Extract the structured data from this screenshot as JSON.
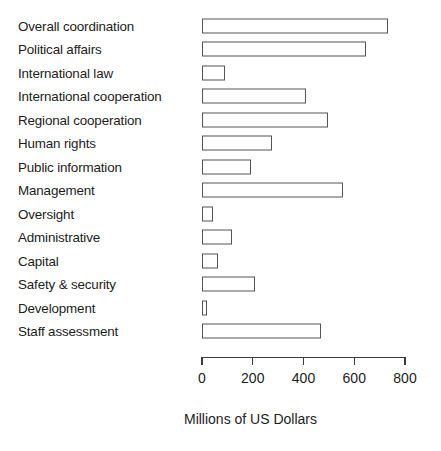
{
  "chart_data": {
    "type": "bar",
    "orientation": "horizontal",
    "title": "",
    "subtitle": "",
    "xlabel": "Millions of US Dollars",
    "ylabel": "",
    "xlim": [
      0,
      800
    ],
    "xticks": [
      0,
      200,
      400,
      600,
      800
    ],
    "xtick_labels": [
      "0",
      "200",
      "400",
      "600",
      "800"
    ],
    "grid": false,
    "legend": false,
    "legend_position": "none",
    "bar_fill_color": "#ffffff",
    "bar_edge_color": "#545454",
    "background_color": "#ffffff",
    "categories": [
      "Overall coordination",
      "Political affairs",
      "International law",
      "International cooperation",
      "Regional cooperation",
      "Human rights",
      "Public information",
      "Management",
      "Oversight",
      "Administrative",
      "Capital",
      "Safety & security",
      "Development",
      "Staff assessment"
    ],
    "values": [
      733,
      645,
      91,
      408,
      495,
      277,
      194,
      554,
      43,
      118,
      62,
      207,
      20,
      470
    ]
  }
}
